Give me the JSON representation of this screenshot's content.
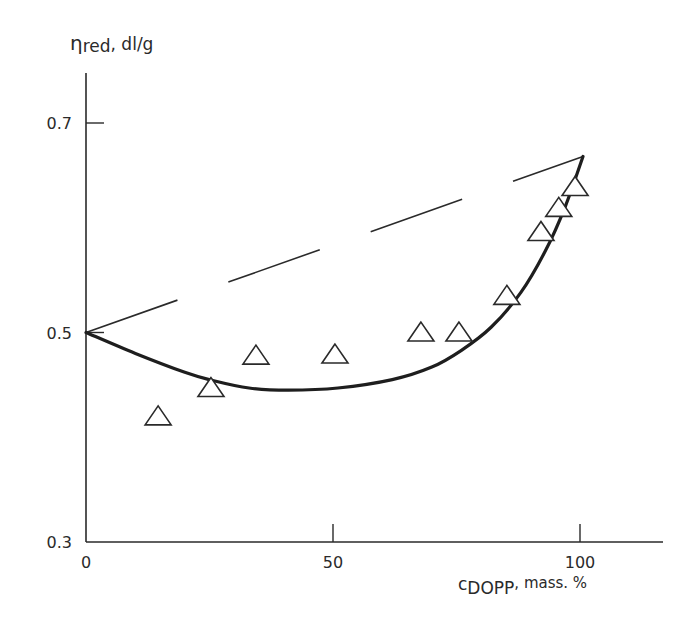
{
  "chart_data": {
    "type": "scatter",
    "title": "",
    "ylabel": "η",
    "ylabel_sub": "red",
    "ylabel_unit": ", dl/g",
    "xlabel": "c",
    "xlabel_sub": "DOPP",
    "xlabel_unit": ", mass. %",
    "xlim": [
      0,
      117
    ],
    "ylim": [
      0.3,
      0.77
    ],
    "x_ticks": [
      0,
      50,
      100
    ],
    "x_tick_labels": [
      "0",
      "50",
      "100"
    ],
    "y_ticks": [
      0.3,
      0.5,
      0.7
    ],
    "y_tick_labels": [
      "0.3",
      "0.5",
      "0.7"
    ],
    "grid": false,
    "legend": null,
    "series": [
      {
        "name": "experimental",
        "marker": "open-triangle",
        "x": [
          14.6,
          25.3,
          34.4,
          50.4,
          67.8,
          75.5,
          85.2,
          92.1,
          95.7,
          99.0
        ],
        "y": [
          0.42,
          0.447,
          0.478,
          0.479,
          0.5,
          0.5,
          0.535,
          0.596,
          0.619,
          0.639
        ]
      },
      {
        "name": "fitted curve",
        "style": "solid-bold",
        "x": [
          0,
          10,
          20,
          25,
          33,
          41,
          51,
          62,
          70,
          76,
          82,
          88,
          93,
          97,
          100
        ],
        "y": [
          0.5,
          0.48,
          0.462,
          0.455,
          0.447,
          0.445,
          0.447,
          0.455,
          0.467,
          0.483,
          0.505,
          0.538,
          0.578,
          0.62,
          0.668
        ]
      },
      {
        "name": "additivity line",
        "style": "dashed",
        "x": [
          0,
          100
        ],
        "y": [
          0.5,
          0.668
        ]
      }
    ]
  }
}
